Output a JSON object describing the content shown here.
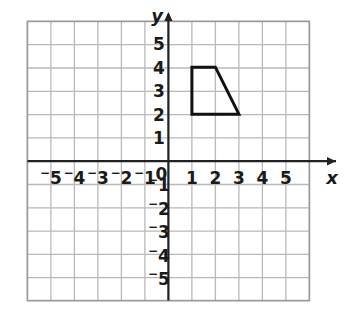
{
  "figure": {
    "background_color": "#ffffff"
  },
  "chart_data": {
    "type": "scatter",
    "title": "",
    "xlabel": "x",
    "ylabel": "y",
    "xlim": [
      -6,
      6
    ],
    "ylim": [
      -6,
      6
    ],
    "grid": true,
    "grid_spacing": 1,
    "grid_color": "#b9b9b9",
    "axis_color": "#222222",
    "legend": "none",
    "x_tick_labels": [
      "⁻5",
      "⁻4",
      "⁻3",
      "⁻2",
      "⁻1",
      "0",
      "1",
      "2",
      "3",
      "4",
      "5"
    ],
    "x_tick_values": [
      -5,
      -4,
      -3,
      -2,
      -1,
      0,
      1,
      2,
      3,
      4,
      5
    ],
    "y_tick_labels": [
      "5",
      "4",
      "3",
      "2",
      "1",
      "⁻1",
      "⁻2",
      "⁻3",
      "⁻4",
      "⁻5"
    ],
    "y_tick_values": [
      5,
      4,
      3,
      2,
      1,
      -1,
      -2,
      -3,
      -4,
      -5
    ],
    "origin_label": "0",
    "x_axis_arrow": true,
    "y_axis_arrow": true,
    "shapes": [
      {
        "name": "quadrilateral",
        "type": "polygon",
        "vertices": [
          [
            1,
            4
          ],
          [
            2,
            4
          ],
          [
            3,
            2
          ],
          [
            1,
            2
          ]
        ],
        "stroke": "#111111",
        "stroke_width": 3,
        "fill": "none"
      }
    ]
  },
  "axis_labels": {
    "x": "x",
    "y": "y"
  }
}
